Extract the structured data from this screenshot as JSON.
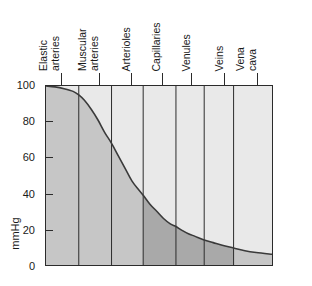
{
  "chart_data": {
    "type": "area",
    "title": "",
    "xlabel": "",
    "ylabel": "mmHg",
    "right_label": "Mean blood pressure",
    "ylim": [
      0,
      100
    ],
    "grid": false,
    "legend": "none",
    "y_ticks": [
      {
        "value": 100,
        "label": "100"
      },
      {
        "value": 80,
        "label": "80"
      },
      {
        "value": 60,
        "label": "60"
      },
      {
        "value": 40,
        "label": "40"
      },
      {
        "value": 20,
        "label": "20"
      },
      {
        "value": 0,
        "label": "0"
      }
    ],
    "categories": [
      {
        "label": "Elastic\narteries",
        "band_start": 0.0,
        "band_end": 0.145,
        "tick_at": 0.072
      },
      {
        "label": "Muscular\narteries",
        "band_start": 0.145,
        "band_end": 0.29,
        "tick_at": 0.24
      },
      {
        "label": "Arterioles",
        "band_start": 0.29,
        "band_end": 0.43,
        "tick_at": 0.38
      },
      {
        "label": "Capillaries",
        "band_start": 0.43,
        "band_end": 0.575,
        "tick_at": 0.515
      },
      {
        "label": "Venules",
        "band_start": 0.575,
        "band_end": 0.7,
        "tick_at": 0.645
      },
      {
        "label": "Veins",
        "band_start": 0.7,
        "band_end": 0.83,
        "tick_at": 0.79
      },
      {
        "label": "Vena\ncava",
        "band_start": 0.83,
        "band_end": 1.0,
        "tick_at": 0.935
      }
    ],
    "series": [
      {
        "name": "Mean blood pressure",
        "x": [
          0.0,
          0.04,
          0.08,
          0.12,
          0.145,
          0.17,
          0.2,
          0.23,
          0.26,
          0.29,
          0.32,
          0.35,
          0.38,
          0.41,
          0.43,
          0.46,
          0.49,
          0.52,
          0.55,
          0.575,
          0.6,
          0.63,
          0.66,
          0.7,
          0.74,
          0.78,
          0.83,
          0.88,
          0.93,
          1.0
        ],
        "values": [
          100,
          99.5,
          98.5,
          97,
          95,
          92,
          87,
          81,
          74,
          68,
          61,
          54,
          47,
          42,
          39,
          34,
          30,
          26,
          23,
          21.5,
          19.5,
          17.5,
          16,
          14,
          12.5,
          11,
          9.5,
          8,
          7,
          6
        ]
      }
    ],
    "colors": {
      "below_curve_light": "#c6c6c6",
      "below_curve_dark": "#a9a9a9",
      "above_curve": "#e9e9e9",
      "curve_line": "#3a3a3a",
      "divider": "#2b2b2b",
      "axis": "#2b2b2b",
      "text": "#1a1a1a",
      "background": "#ffffff"
    },
    "shading_note": {
      "dark_region_start": 0.43,
      "dark_region_end": 0.83
    }
  }
}
